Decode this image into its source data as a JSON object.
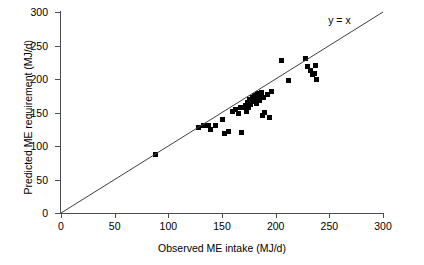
{
  "chart_data": {
    "type": "scatter",
    "title": "",
    "xlabel": "Observed ME intake (MJ/d)",
    "ylabel": "Predicted ME requirement (MJ/d)",
    "xlim": [
      0,
      300
    ],
    "ylim": [
      0,
      300
    ],
    "xticks": [
      0,
      50,
      100,
      150,
      200,
      250,
      300
    ],
    "yticks": [
      0,
      50,
      100,
      150,
      200,
      250,
      300
    ],
    "grid": false,
    "legend": false,
    "annotations": [
      {
        "text": "y = x",
        "x": 262,
        "y": 288,
        "describes": "identity-line"
      }
    ],
    "reference_line": {
      "name": "identity-line",
      "label": "y = x",
      "equation": "y = x",
      "from": [
        0,
        0
      ],
      "to": [
        300,
        300
      ],
      "color": "#3f3f3f"
    },
    "series": [
      {
        "name": "Predicted ME requirement vs Observed ME intake",
        "marker": "square",
        "color": "#000000",
        "points": [
          [
            88,
            88
          ],
          [
            128,
            127
          ],
          [
            133,
            130
          ],
          [
            137,
            131
          ],
          [
            139,
            124
          ],
          [
            144,
            131
          ],
          [
            150,
            140
          ],
          [
            152,
            119
          ],
          [
            156,
            121
          ],
          [
            160,
            152
          ],
          [
            163,
            155
          ],
          [
            165,
            149
          ],
          [
            167,
            158
          ],
          [
            168,
            120
          ],
          [
            170,
            157
          ],
          [
            172,
            160
          ],
          [
            173,
            152
          ],
          [
            174,
            165
          ],
          [
            175,
            158
          ],
          [
            176,
            170
          ],
          [
            177,
            162
          ],
          [
            178,
            173
          ],
          [
            179,
            166
          ],
          [
            180,
            176
          ],
          [
            181,
            170
          ],
          [
            182,
            163
          ],
          [
            183,
            178
          ],
          [
            184,
            172
          ],
          [
            185,
            168
          ],
          [
            186,
            175
          ],
          [
            187,
            180
          ],
          [
            188,
            145
          ],
          [
            189,
            172
          ],
          [
            190,
            150
          ],
          [
            192,
            177
          ],
          [
            194,
            142
          ],
          [
            196,
            182
          ],
          [
            205,
            228
          ],
          [
            212,
            198
          ],
          [
            228,
            230
          ],
          [
            230,
            218
          ],
          [
            232,
            213
          ],
          [
            234,
            206
          ],
          [
            236,
            208
          ],
          [
            237,
            220
          ],
          [
            238,
            200
          ]
        ]
      }
    ]
  }
}
